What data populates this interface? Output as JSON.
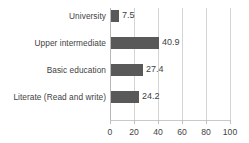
{
  "chart_data": {
    "type": "bar",
    "orientation": "horizontal",
    "title": "",
    "subtitle": "",
    "xlabel": "",
    "ylabel": "",
    "categories": [
      "University",
      "Upper intermediate",
      "Basic education",
      "Literate (Read and write)"
    ],
    "values": [
      7.5,
      40.9,
      27.4,
      24.2
    ],
    "value_labels": [
      "7.5",
      "40.9",
      "27.4",
      "24.2"
    ],
    "series": [
      {
        "name": "",
        "values": [
          7.5,
          40.9,
          27.4,
          24.2
        ]
      }
    ],
    "xlim": [
      0,
      100
    ],
    "ylim": null,
    "x_ticks": [
      0,
      20,
      40,
      60,
      80,
      100
    ],
    "x_tick_labels": [
      "0",
      "20",
      "40",
      "60",
      "80",
      "100"
    ],
    "grid": "vertical",
    "legend": "none",
    "bar_color": "#595959",
    "gridline_color": "#d4d4d4",
    "text_color": "#3f3f3f",
    "background": "#ffffff",
    "data_labels_shown": true
  }
}
